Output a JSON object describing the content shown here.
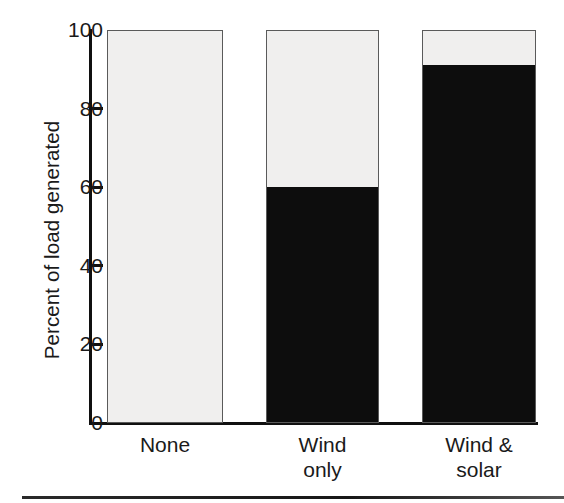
{
  "chart_data": {
    "type": "bar",
    "subtype": "stacked-bar",
    "title": "",
    "xlabel": "",
    "ylabel": "Percent of load generated",
    "categories": [
      "None",
      "Wind only",
      "Wind & solar"
    ],
    "category_lines": [
      [
        "None"
      ],
      [
        "Wind",
        "only"
      ],
      [
        "Wind &",
        "solar"
      ]
    ],
    "ylim": [
      0,
      100
    ],
    "yticks": [
      0,
      20,
      40,
      60,
      80,
      100
    ],
    "ytick_labels": [
      "0",
      "20",
      "40",
      "60",
      "80",
      "100"
    ],
    "grid": false,
    "legend": false,
    "series": [
      {
        "name": "Load generated by renewables",
        "color": "#0d0d0d",
        "values": [
          0,
          60,
          91
        ]
      },
      {
        "name": "Remaining load",
        "color": "#f0efee",
        "values": [
          100,
          40,
          9
        ]
      }
    ],
    "annotations": []
  },
  "axis": {
    "tick_color": "#101010",
    "label_color": "#1a1a1a"
  },
  "figure": {
    "background": "#ffffff",
    "rule_color": "#1a1a1a"
  }
}
